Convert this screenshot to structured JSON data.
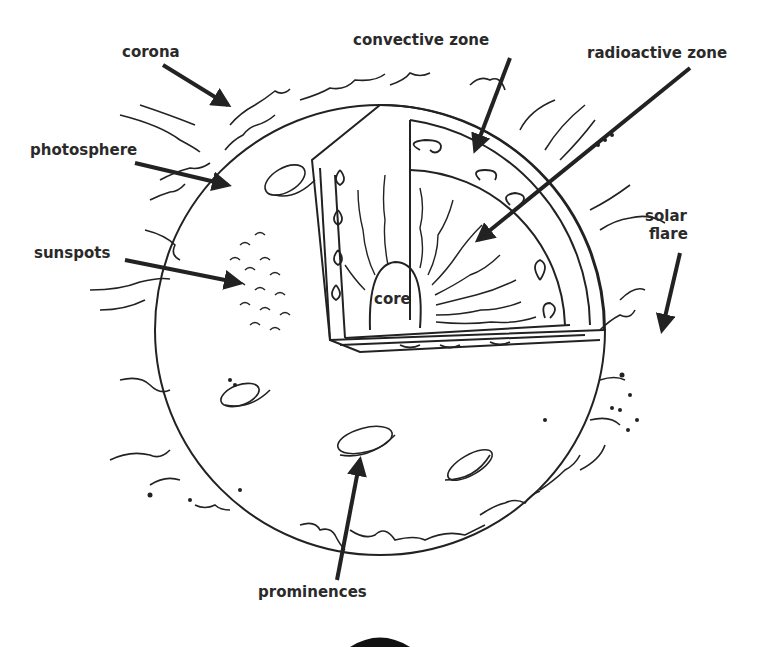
{
  "diagram": {
    "labels": {
      "corona": "corona",
      "convective_zone": "convective zone",
      "radioactive_zone": "radioactive zone",
      "photosphere": "photosphere",
      "solar_flare_line1": "solar",
      "solar_flare_line2": "flare",
      "sunspots": "sunspots",
      "core": "core",
      "prominences": "prominences"
    },
    "colors": {
      "ink": "#222222",
      "background": "#ffffff"
    }
  }
}
